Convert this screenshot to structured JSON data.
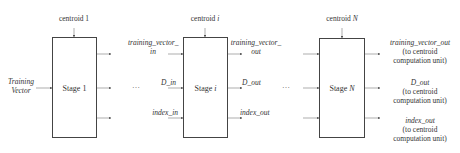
{
  "input": {
    "line1": "Training",
    "line2": "Vector"
  },
  "stages": [
    {
      "label_prefix": "Stage ",
      "label_var": "1",
      "centroid_prefix": "centroid ",
      "centroid_var": "1"
    },
    {
      "label_prefix": "Stage ",
      "label_var": "i",
      "centroid_prefix": "centroid ",
      "centroid_var": "i"
    },
    {
      "label_prefix": "Stage ",
      "label_var": "N",
      "centroid_prefix": "centroid ",
      "centroid_var": "N"
    }
  ],
  "stage_i_inputs": {
    "training_vector_line1": "training_vector_",
    "training_vector_line2": "in",
    "d": "D_in",
    "index": "index_in"
  },
  "stage_i_outputs": {
    "training_vector_line1": "training_vector_",
    "training_vector_line2": "out",
    "d": "D_out",
    "index": "index_out"
  },
  "final_outputs": [
    {
      "name": "training_vector_out",
      "note1": "(to centroid",
      "note2": "computation unit)"
    },
    {
      "name": "D_out",
      "note1": "(to centroid",
      "note2": "computation unit)"
    },
    {
      "name": "index_out",
      "note1": "(to centroid",
      "note2": "computation unit)"
    }
  ],
  "ellipsis": "…",
  "colors": {
    "line": "#555555",
    "box": "#444444",
    "text": "#333333"
  }
}
